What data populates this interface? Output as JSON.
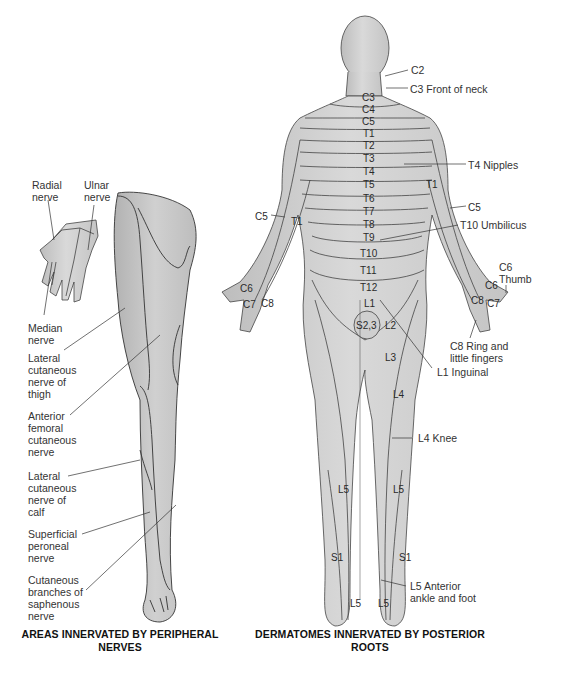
{
  "left_panel": {
    "caption_line1": "AREAS INNERVATED BY PERIPHERAL",
    "caption_line2": "NERVES",
    "labels": {
      "radial": [
        "Radial",
        "nerve"
      ],
      "ulnar": [
        "Ulnar",
        "nerve"
      ],
      "median": [
        "Median",
        "nerve"
      ],
      "lat_thigh": [
        "Lateral",
        "cutaneous",
        "nerve of",
        "thigh"
      ],
      "ant_femoral": [
        "Anterior",
        "femoral",
        "cutaneous",
        "nerve"
      ],
      "lat_calf": [
        "Lateral",
        "cutaneous",
        "nerve of",
        "calf"
      ],
      "sup_peroneal": [
        "Superficial",
        "peroneal",
        "nerve"
      ],
      "saphenous": [
        "Cutaneous",
        "branches of",
        "saphenous",
        "nerve"
      ]
    }
  },
  "right_panel": {
    "caption_line1": "DERMATOMES INNERVATED BY POSTERIOR",
    "caption_line2": "ROOTS",
    "callouts": {
      "c2": "C2",
      "c3": "C3 Front of neck",
      "t4": "T4 Nipples",
      "t10": "T10 Umbilicus",
      "c6": [
        "C6",
        "Thumb"
      ],
      "c8": [
        "C8 Ring and",
        "little fingers"
      ],
      "l1": "L1 Inguinal",
      "l4": "L4 Knee",
      "l5": [
        "L5 Anterior",
        "ankle and foot"
      ]
    },
    "segments": {
      "trunk": [
        "C3",
        "C4",
        "C5",
        "T1",
        "T2",
        "T3",
        "T4",
        "T5",
        "T6",
        "T7",
        "T8",
        "T9",
        "T10",
        "T11",
        "T12",
        "L1"
      ],
      "s23": "S2,3",
      "l2": "L2",
      "l3": "L3",
      "l4": "L4",
      "l5_l": "L5",
      "l5_r": "L5",
      "s1_l": "S1",
      "s1_r": "S1",
      "l5_foot_l": "L5",
      "l5_foot_r": "L5",
      "arm_r_c5": "C5",
      "arm_r_t1": "T1",
      "hand_r_c6": "C6",
      "hand_r_c7": "C7",
      "hand_r_c8": "C8",
      "arm_l_t1": "T1",
      "arm_l_c5": "C5",
      "hand_l_c6": "C6",
      "hand_l_c8": "C8",
      "hand_l_c7": "C7"
    }
  }
}
